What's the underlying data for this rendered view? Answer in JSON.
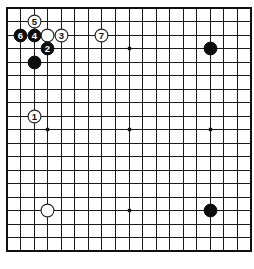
{
  "diagram": {
    "type": "go-board",
    "board_size": 19,
    "colors": {
      "background": "#ffffff",
      "line": "#1a1a1a",
      "black_stone": "#0d0d0d",
      "white_stone": "#ffffff"
    },
    "star_points": [
      {
        "col": 3,
        "row": 3
      },
      {
        "col": 9,
        "row": 3
      },
      {
        "col": 15,
        "row": 3
      },
      {
        "col": 3,
        "row": 9
      },
      {
        "col": 9,
        "row": 9
      },
      {
        "col": 15,
        "row": 9
      },
      {
        "col": 3,
        "row": 15
      },
      {
        "col": 9,
        "row": 15
      },
      {
        "col": 15,
        "row": 15
      }
    ],
    "stones": [
      {
        "color": "black",
        "col": 15,
        "row": 3,
        "label": ""
      },
      {
        "color": "black",
        "col": 15,
        "row": 15,
        "label": ""
      },
      {
        "color": "white",
        "col": 3,
        "row": 15,
        "label": ""
      },
      {
        "color": "black",
        "col": 2,
        "row": 4,
        "label": ""
      },
      {
        "color": "white",
        "col": 3,
        "row": 2,
        "label": ""
      },
      {
        "color": "white",
        "col": 2,
        "row": 8,
        "label": "1"
      },
      {
        "color": "black",
        "col": 3,
        "row": 3,
        "label": "2"
      },
      {
        "color": "white",
        "col": 4,
        "row": 2,
        "label": "3"
      },
      {
        "color": "black",
        "col": 2,
        "row": 2,
        "label": "4"
      },
      {
        "color": "white",
        "col": 2,
        "row": 1,
        "label": "5"
      },
      {
        "color": "black",
        "col": 1,
        "row": 2,
        "label": "6"
      },
      {
        "color": "white",
        "col": 7,
        "row": 2,
        "label": "7"
      }
    ]
  }
}
